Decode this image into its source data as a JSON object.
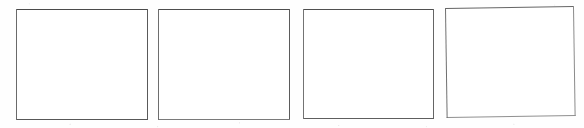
{
  "document": {
    "type": "scanned-form-fragment",
    "description": "Row of four empty rectangular form boxes on white paper",
    "width": 584,
    "height": 128,
    "background_color": "#fefefe",
    "page_label": "",
    "notes": ""
  },
  "style": {
    "border_color": "#4f4f4f",
    "box_fill": "#ffffff",
    "border_width_px": 1
  },
  "boxes": [
    {
      "id": "box-1",
      "label": "",
      "value": "",
      "x": 16,
      "y": 9,
      "width": 132,
      "height": 111,
      "fill": "#ffffff",
      "border_color": "#4f4f4f",
      "rotation_deg": 0
    },
    {
      "id": "box-2",
      "label": "",
      "value": "",
      "x": 158,
      "y": 9,
      "width": 132,
      "height": 111,
      "fill": "#ffffff",
      "border_color": "#4f4f4f",
      "rotation_deg": 0
    },
    {
      "id": "box-3",
      "label": "",
      "value": "",
      "x": 303,
      "y": 9,
      "width": 131,
      "height": 110,
      "fill": "#ffffff",
      "border_color": "#4f4f4f",
      "rotation_deg": 0
    },
    {
      "id": "box-4",
      "label": "",
      "value": "",
      "x": 445,
      "y": 8,
      "width": 129,
      "height": 110,
      "fill": "#ffffff",
      "border_color": "#7a7a7a",
      "rotation_deg": -0.85
    }
  ]
}
